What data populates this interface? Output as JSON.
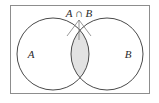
{
  "figure": {
    "type": "venn-diagram",
    "background_color": "#ffffff"
  },
  "universal_set": {
    "name": "universe-rectangle",
    "stroke_color": "#8d8d8d",
    "fill_color": "#ffffff",
    "x": 10,
    "y": 5,
    "width": 140,
    "height": 89
  },
  "sets": [
    {
      "id": "A",
      "label": "A",
      "center_x": 53,
      "center_y": 54,
      "radius": 36,
      "stroke_color": "#4a4a4a",
      "label_x": 31,
      "label_y": 58
    },
    {
      "id": "B",
      "label": "B",
      "center_x": 107,
      "center_y": 54,
      "radius": 36,
      "stroke_color": "#4a4a4a",
      "label_x": 128,
      "label_y": 58
    }
  ],
  "intersection": {
    "name": "A-intersect-B",
    "label_parts": {
      "left_operand": "A",
      "operator": "∩",
      "right_operand": "B"
    },
    "label_full": "A ∩ B",
    "label_x": 79,
    "label_y": 17,
    "fill_color": "#e2e2e2",
    "stroke_color": "#4a4a4a",
    "shaded": true
  },
  "leader_lines": {
    "name": "callout-leader-lines",
    "stroke_color": "#6e6e6e",
    "apex_x": 79,
    "apex_y": 20,
    "targets": [
      {
        "x": 67,
        "y": 36
      },
      {
        "x": 79,
        "y": 40
      },
      {
        "x": 91,
        "y": 36
      }
    ]
  }
}
